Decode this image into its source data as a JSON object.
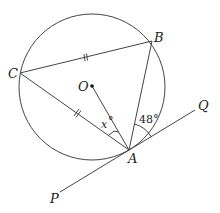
{
  "diagram": {
    "points": {
      "A": {
        "label": "A",
        "x": 129,
        "y": 150
      },
      "B": {
        "label": "B",
        "x": 152,
        "y": 40
      },
      "C": {
        "label": "C",
        "x": 20,
        "y": 73
      },
      "O": {
        "label": "O",
        "x": 92,
        "y": 86
      },
      "P": {
        "label": "P",
        "x": 60,
        "y": 190
      },
      "Q": {
        "label": "Q",
        "x": 196,
        "y": 111
      }
    },
    "circle": {
      "cx": 92,
      "cy": 87,
      "r": 73
    },
    "angles": {
      "OAC": {
        "label_var": "x",
        "label_deg": "°"
      },
      "BAQ": {
        "label": "48°"
      }
    },
    "equal_marks": [
      "CB",
      "CA"
    ],
    "colors": {
      "stroke": "#333333",
      "background": "#ffffff"
    }
  }
}
